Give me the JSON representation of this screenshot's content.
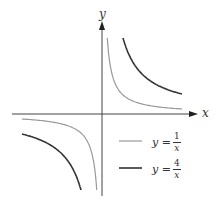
{
  "chart_data": {
    "type": "line",
    "title": "",
    "xlabel": "x",
    "ylabel": "y",
    "grid": false,
    "legend_position": "lower-right",
    "series": [
      {
        "name": "y = 1/x",
        "label_lhs": "y =",
        "numerator": "1",
        "denominator": "x",
        "color": "#999999",
        "k": 1
      },
      {
        "name": "y = 4/x",
        "label_lhs": "y =",
        "numerator": "4",
        "denominator": "x",
        "color": "#333333",
        "k": 4
      }
    ]
  },
  "axes": {
    "x_label": "x",
    "y_label": "y"
  },
  "legend": [
    {
      "lhs": "y =",
      "num": "1",
      "den": "x"
    },
    {
      "lhs": "y =",
      "num": "4",
      "den": "x"
    }
  ]
}
